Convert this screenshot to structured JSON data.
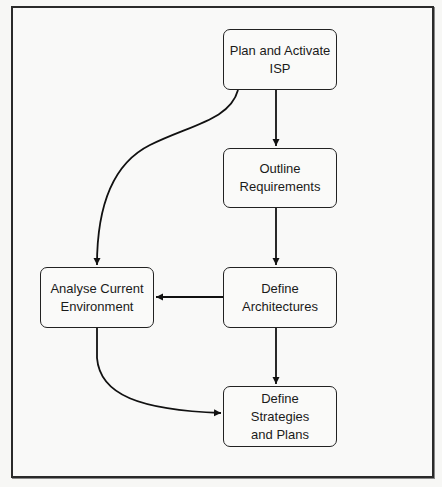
{
  "diagram": {
    "nodes": [
      {
        "id": "plan",
        "label": "Plan and Activate\nISP"
      },
      {
        "id": "outline",
        "label": "Outline\nRequirements"
      },
      {
        "id": "architectures",
        "label": "Define\nArchitectures"
      },
      {
        "id": "analyse",
        "label": "Analyse Current\nEnvironment"
      },
      {
        "id": "strategies",
        "label": "Define\nStrategies\nand Plans"
      }
    ],
    "edges": [
      {
        "from": "plan",
        "to": "outline",
        "style": "straight"
      },
      {
        "from": "plan",
        "to": "analyse",
        "style": "curved"
      },
      {
        "from": "outline",
        "to": "architectures",
        "style": "straight"
      },
      {
        "from": "architectures",
        "to": "analyse",
        "style": "straight"
      },
      {
        "from": "architectures",
        "to": "strategies",
        "style": "straight"
      },
      {
        "from": "analyse",
        "to": "strategies",
        "style": "curved"
      }
    ]
  }
}
